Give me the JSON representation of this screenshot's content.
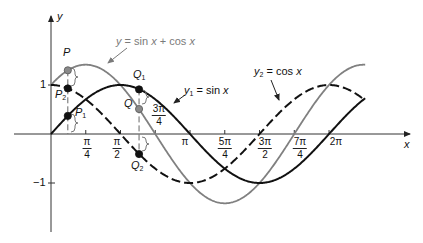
{
  "figure": {
    "axes": {
      "x_label": "x",
      "y_label": "y",
      "y_tick_pos": "1",
      "y_tick_neg": "−1"
    },
    "x_ticks": [
      {
        "id": "pi_4",
        "num": "π",
        "den": "4"
      },
      {
        "id": "pi_2",
        "num": "π",
        "den": "2"
      },
      {
        "id": "3pi_4",
        "num": "3π",
        "den": "4"
      },
      {
        "id": "pi",
        "num": "π",
        "den": ""
      },
      {
        "id": "5pi_4",
        "num": "5π",
        "den": "4"
      },
      {
        "id": "3pi_2",
        "num": "3π",
        "den": "2"
      },
      {
        "id": "7pi_4",
        "num": "7π",
        "den": "4"
      },
      {
        "id": "2pi",
        "num": "2π",
        "den": ""
      }
    ],
    "curve_labels": {
      "sum": {
        "var": "y",
        "sub": "",
        "mid": " = sin ",
        "var2": "x",
        "tail": " + cos ",
        "var3": "x"
      },
      "sin": {
        "var": "y",
        "sub": "1",
        "mid": " = sin ",
        "var2": "x"
      },
      "cos": {
        "var": "y",
        "sub": "2",
        "mid": " = cos ",
        "var2": "x"
      }
    },
    "points": {
      "P": {
        "name": "P",
        "sub": ""
      },
      "P1": {
        "name": "P",
        "sub": "1"
      },
      "P2": {
        "name": "P",
        "sub": "2"
      },
      "Q": {
        "name": "Q",
        "sub": ""
      },
      "Q1": {
        "name": "Q",
        "sub": "1"
      },
      "Q2": {
        "name": "Q",
        "sub": "2"
      }
    }
  },
  "chart_data": {
    "type": "line",
    "title": "",
    "xlabel": "x",
    "ylabel": "y",
    "xlim": [
      0,
      7.1
    ],
    "ylim": [
      -2.0,
      2.4
    ],
    "grid": false,
    "legend": "inline annotations with arrows",
    "x_tick_values": [
      0.7854,
      1.5708,
      2.3562,
      3.1416,
      3.927,
      4.7124,
      5.4978,
      6.2832
    ],
    "x_tick_labels": [
      "π/4",
      "π/2",
      "3π/4",
      "π",
      "5π/4",
      "3π/2",
      "7π/4",
      "2π"
    ],
    "y_tick_values": [
      1,
      -1
    ],
    "y_tick_labels": [
      "1",
      "−1"
    ],
    "series": [
      {
        "id": "sin",
        "name": "y1 = sin x",
        "function": "sin",
        "style": "solid",
        "color": "#111111",
        "values_at_ticks": [
          0.707,
          1.0,
          0.707,
          0.0,
          -0.707,
          -1.0,
          -0.707,
          0.0
        ]
      },
      {
        "id": "cos",
        "name": "y2 = cos x",
        "function": "cos",
        "style": "dashed",
        "color": "#111111",
        "values_at_ticks": [
          0.707,
          0.0,
          -0.707,
          -1.0,
          -0.707,
          0.0,
          0.707,
          1.0
        ]
      },
      {
        "id": "sum",
        "name": "y = sin x + cos x",
        "function": "sin+cos",
        "style": "solid",
        "color": "#808080",
        "values_at_ticks": [
          1.414,
          1.0,
          0.0,
          -1.0,
          -1.414,
          -1.0,
          0.0,
          1.0
        ]
      }
    ],
    "annotated_points": [
      {
        "label": "P",
        "x": 0.38,
        "y": 1.3,
        "series": "sum"
      },
      {
        "label": "P1",
        "x": 0.38,
        "y": 0.37,
        "series": "sin"
      },
      {
        "label": "P2",
        "x": 0.38,
        "y": 0.93,
        "series": "cos"
      },
      {
        "label": "Q",
        "x": 1.99,
        "y": 0.51,
        "series": "sum"
      },
      {
        "label": "Q1",
        "x": 1.99,
        "y": 0.91,
        "series": "sin"
      },
      {
        "label": "Q2",
        "x": 1.99,
        "y": -0.41,
        "series": "cos"
      }
    ]
  }
}
